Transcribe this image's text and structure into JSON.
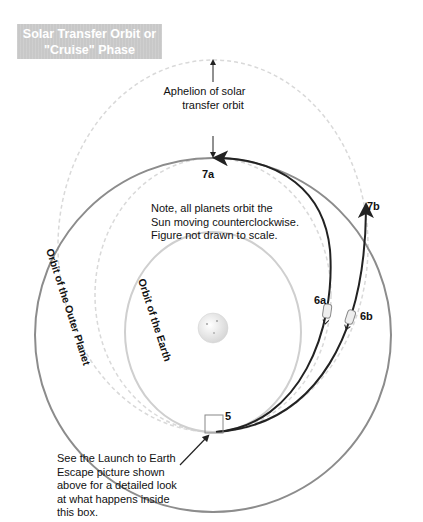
{
  "title": {
    "line1": "Solar Transfer Orbit or",
    "line2": "\"Cruise\" Phase"
  },
  "annotations": {
    "aphelion": {
      "line1": "Aphelion of solar",
      "line2": "transfer orbit"
    },
    "note": {
      "line1": "Note, all planets orbit the",
      "line2": "Sun moving counterclockwise.",
      "line3": "Figure not drawn to scale."
    },
    "launch_box": {
      "line1": "See the Launch to Earth",
      "line2": "Escape picture shown",
      "line3": "above for a detailed look",
      "line4": "at what happens inside",
      "line5": "this box."
    }
  },
  "orbit_labels": {
    "outer": "Orbit of the Outer Planet",
    "earth": "Orbit of the Earth"
  },
  "points": {
    "p5": "5",
    "p6a": "6a",
    "p6b": "6b",
    "p7a": "7a",
    "p7b": "7b"
  },
  "colors": {
    "outer_orbit": "#8c8c8c",
    "earth_orbit": "#cfcfcf",
    "dashed_orbit": "#d6d6d6",
    "trajectory": "#222222",
    "title_bg": "#c8c8c8"
  }
}
